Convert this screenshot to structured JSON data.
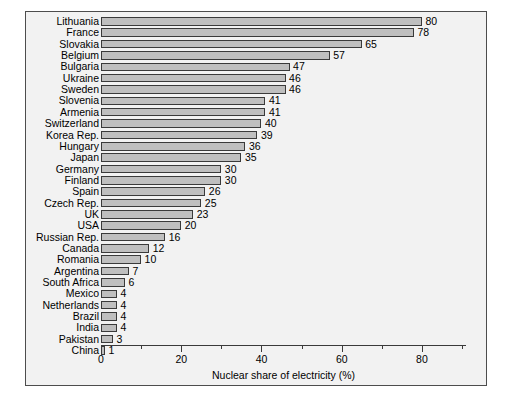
{
  "chart_data": {
    "type": "bar",
    "orientation": "horizontal",
    "title": "",
    "subtitle": "",
    "xlabel": "Nuclear share of electricity (%)",
    "ylabel": "",
    "xlim": [
      0,
      91
    ],
    "xticks": [
      0,
      20,
      40,
      60,
      80
    ],
    "xtick_labels": [
      "0",
      "20",
      "40",
      "60",
      "80"
    ],
    "xminor_ticks": [
      10,
      30,
      50,
      70,
      90
    ],
    "grid": false,
    "legend": null,
    "categories": [
      "Lithuania",
      "France",
      "Slovakia",
      "Belgium",
      "Bulgaria",
      "Ukraine",
      "Sweden",
      "Slovenia",
      "Armenia",
      "Switzerland",
      "Korea Rep.",
      "Hungary",
      "Japan",
      "Germany",
      "Finland",
      "Spain",
      "Czech Rep.",
      "UK",
      "USA",
      "Russian Rep.",
      "Canada",
      "Romania",
      "Argentina",
      "South Africa",
      "Mexico",
      "Netherlands",
      "Brazil",
      "India",
      "Pakistan",
      "China"
    ],
    "values": [
      80,
      78,
      65,
      57,
      47,
      46,
      46,
      41,
      41,
      40,
      39,
      36,
      35,
      30,
      30,
      26,
      25,
      23,
      20,
      16,
      12,
      10,
      7,
      6,
      4,
      4,
      4,
      4,
      3,
      1
    ],
    "value_labels": [
      "80",
      "78",
      "65",
      "57",
      "47",
      "46",
      "46",
      "41",
      "41",
      "40",
      "39",
      "36",
      "35",
      "30",
      "30",
      "26",
      "25",
      "23",
      "20",
      "16",
      "12",
      "10",
      "7",
      "6",
      "4",
      "4",
      "4",
      "4",
      "3",
      "1"
    ],
    "colors": {
      "bar_fill": "#bfbfbf",
      "bar_edge": "#3a3a3a",
      "panel_background": "#f2f2f2",
      "page_background": "#ffffff",
      "axis": "#3a3a3a",
      "text": "#000000"
    }
  }
}
